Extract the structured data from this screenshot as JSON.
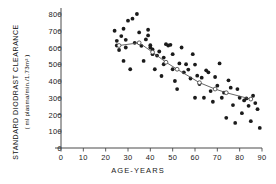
{
  "chart_data": {
    "type": "scatter",
    "title": "",
    "xlabel": "AGE-YEARS",
    "ylabel_line1": "STANDARD  DIODRAST  CLEARANCE",
    "ylabel_line2": "( ml plasma/min./1.73m² )",
    "xlim": [
      0,
      90
    ],
    "ylim": [
      0,
      800
    ],
    "xticks": [
      0,
      10,
      20,
      30,
      40,
      50,
      60,
      70,
      80,
      90
    ],
    "yticks": [
      0,
      100,
      200,
      300,
      400,
      500,
      600,
      700,
      800
    ],
    "grid": false,
    "legend": "none",
    "series": [
      {
        "name": "individual subjects",
        "marker": "filled-circle",
        "points": [
          [
            24,
            700
          ],
          [
            25,
            640
          ],
          [
            25,
            612
          ],
          [
            26,
            585
          ],
          [
            27,
            668
          ],
          [
            28,
            712
          ],
          [
            28,
            520
          ],
          [
            29,
            646
          ],
          [
            29,
            600
          ],
          [
            30,
            760
          ],
          [
            31,
            470
          ],
          [
            32,
            772
          ],
          [
            33,
            628
          ],
          [
            34,
            800
          ],
          [
            35,
            690
          ],
          [
            36,
            610
          ],
          [
            37,
            520
          ],
          [
            38,
            648
          ],
          [
            39,
            706
          ],
          [
            39,
            672
          ],
          [
            40,
            614
          ],
          [
            40,
            600
          ],
          [
            41,
            588
          ],
          [
            41,
            560
          ],
          [
            42,
            470
          ],
          [
            43,
            552
          ],
          [
            44,
            576
          ],
          [
            45,
            430
          ],
          [
            46,
            540
          ],
          [
            46,
            500
          ],
          [
            47,
            620
          ],
          [
            48,
            612
          ],
          [
            49,
            616
          ],
          [
            50,
            470
          ],
          [
            50,
            560
          ],
          [
            51,
            400
          ],
          [
            52,
            352
          ],
          [
            53,
            505
          ],
          [
            54,
            600
          ],
          [
            55,
            452
          ],
          [
            56,
            500
          ],
          [
            57,
            468
          ],
          [
            58,
            415
          ],
          [
            59,
            560
          ],
          [
            60,
            498
          ],
          [
            60,
            300
          ],
          [
            61,
            432
          ],
          [
            62,
            382
          ],
          [
            63,
            420
          ],
          [
            64,
            300
          ],
          [
            65,
            464
          ],
          [
            66,
            452
          ],
          [
            67,
            340
          ],
          [
            68,
            276
          ],
          [
            69,
            424
          ],
          [
            70,
            372
          ],
          [
            71,
            505
          ],
          [
            72,
            300
          ],
          [
            73,
            330
          ],
          [
            74,
            180
          ],
          [
            75,
            404
          ],
          [
            76,
            360
          ],
          [
            77,
            256
          ],
          [
            78,
            150
          ],
          [
            79,
            352
          ],
          [
            80,
            300
          ],
          [
            81,
            208
          ],
          [
            82,
            284
          ],
          [
            83,
            296
          ],
          [
            84,
            252
          ],
          [
            85,
            160
          ],
          [
            86,
            312
          ],
          [
            87,
            268
          ],
          [
            88,
            232
          ],
          [
            89,
            120
          ]
        ]
      },
      {
        "name": "decade mean trend",
        "marker": "open-circle",
        "line": true,
        "points": [
          [
            26,
            612
          ],
          [
            35,
            628
          ],
          [
            41,
            572
          ],
          [
            47,
            512
          ],
          [
            52,
            470
          ],
          [
            62,
            390
          ],
          [
            69,
            352
          ],
          [
            74,
            330
          ],
          [
            85,
            292
          ]
        ]
      }
    ]
  }
}
